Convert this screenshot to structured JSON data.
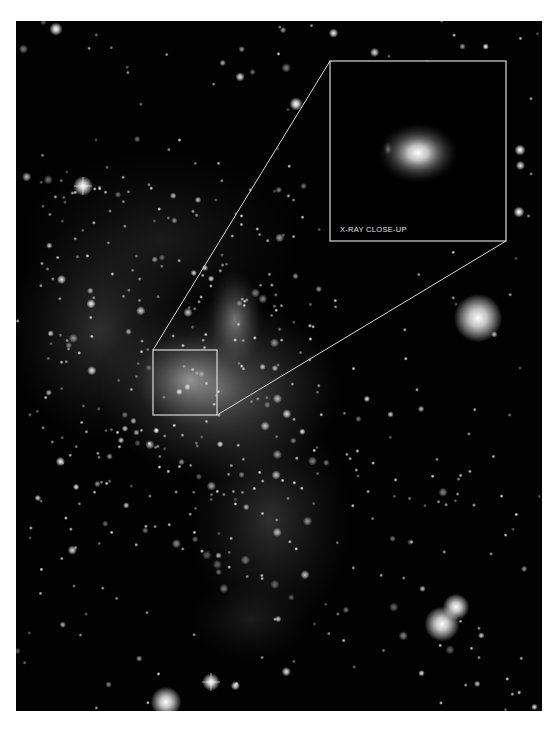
{
  "image": {
    "description": "Grayscale X-ray/infrared starfield of a galactic center region with a bright nebulous cluster and an annotated zoom inset",
    "frame": {
      "x": 16,
      "y": 21,
      "width": 526,
      "height": 690
    },
    "background_color": "#020202",
    "page_background": "#ffffff",
    "annotation_color": "#d8d8d8"
  },
  "inset": {
    "label": "X-RAY CLOSE-UP",
    "box": {
      "x": 330,
      "y": 61,
      "width": 176,
      "height": 180
    },
    "source_box": {
      "x": 153,
      "y": 350,
      "width": 64,
      "height": 65
    },
    "blob": {
      "cx": 418,
      "cy": 153,
      "rx": 40,
      "ry": 30
    }
  },
  "nebulae": [
    {
      "cx": 220,
      "cy": 390,
      "rx": 120,
      "ry": 90,
      "opacity": 0.45
    },
    {
      "cx": 190,
      "cy": 380,
      "rx": 55,
      "ry": 45,
      "opacity": 0.6
    },
    {
      "cx": 235,
      "cy": 320,
      "rx": 28,
      "ry": 50,
      "opacity": 0.55
    },
    {
      "cx": 100,
      "cy": 330,
      "rx": 90,
      "ry": 110,
      "opacity": 0.22
    },
    {
      "cx": 270,
      "cy": 520,
      "rx": 80,
      "ry": 110,
      "opacity": 0.22
    },
    {
      "cx": 250,
      "cy": 620,
      "rx": 60,
      "ry": 40,
      "opacity": 0.12
    },
    {
      "cx": 160,
      "cy": 240,
      "rx": 140,
      "ry": 90,
      "opacity": 0.12
    }
  ],
  "bright_stars": [
    {
      "cx": 83,
      "cy": 186,
      "r": 4.5,
      "spikes": true
    },
    {
      "cx": 211,
      "cy": 682,
      "r": 4,
      "spikes": true
    },
    {
      "cx": 478,
      "cy": 318,
      "r": 11
    },
    {
      "cx": 442,
      "cy": 624,
      "r": 8
    },
    {
      "cx": 456,
      "cy": 607,
      "r": 6
    },
    {
      "cx": 166,
      "cy": 702,
      "r": 7
    },
    {
      "cx": 296,
      "cy": 104,
      "r": 3
    },
    {
      "cx": 56,
      "cy": 29,
      "r": 3
    },
    {
      "cx": 520,
      "cy": 150,
      "r": 2.5
    },
    {
      "cx": 519,
      "cy": 212,
      "r": 2.5
    }
  ],
  "star_seed": 7,
  "star_count": 520
}
